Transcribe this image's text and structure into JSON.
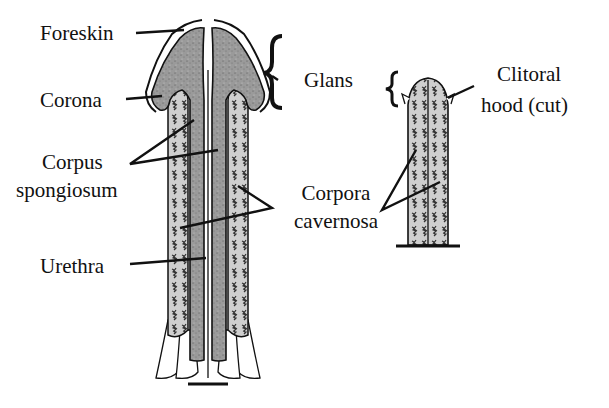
{
  "diagram": {
    "type": "anatomical comparison",
    "colors": {
      "background": "#ffffff",
      "spongy_tissue": "#9a9a9a",
      "cavernous_tissue": "#c8c8c8",
      "outline": "#111111"
    },
    "labels": {
      "foreskin": "Foreskin",
      "corona": "Corona",
      "corpus_1": "Corpus",
      "corpus_2": "spongiosum",
      "glans": "Glans",
      "clitoral_1": "Clitoral",
      "clitoral_2": "hood (cut)",
      "corpora_1": "Corpora",
      "corpora_2": "cavernosa",
      "urethra": "Urethra"
    },
    "structures": [
      "penis-cross-section",
      "clitoris-cross-section"
    ]
  }
}
